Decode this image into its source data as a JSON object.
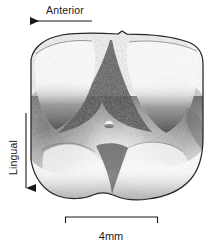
{
  "figure": {
    "kind": "scientific-illustration",
    "background_color": "#ffffff",
    "ink_color": "#1a1a1a"
  },
  "orientation_labels": {
    "anterior": {
      "text": "Anterior",
      "arrow_direction": "left",
      "arrow_x_start": 92,
      "arrow_x_end": 20,
      "arrow_y": 21
    },
    "lingual": {
      "text": "Lingual",
      "arrow_direction": "down",
      "arrow_y_start": 113,
      "arrow_y_end": 196,
      "arrow_x": 26,
      "text_rotation_deg": -90
    }
  },
  "scale_bar": {
    "label": "4mm",
    "x_start": 65,
    "x_end": 158,
    "y": 217,
    "tick_length": 6
  },
  "specimen": {
    "outline_color": "#2a2a2a",
    "shading_style": "stipple-pencil",
    "cusp_count": 2,
    "lobe_count": 2,
    "bounds": {
      "left": 28,
      "top": 33,
      "right": 205,
      "bottom": 202
    }
  }
}
